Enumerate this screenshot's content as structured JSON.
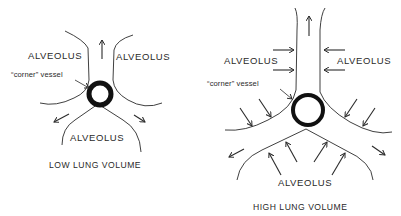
{
  "panels": [
    {
      "id": "low",
      "caption": "LOW LUNG VOLUME",
      "labels": {
        "top_left": "ALVEOLUS",
        "top_right": "ALVEOLUS",
        "bottom": "ALVEOLUS",
        "vessel": "“corner” vessel"
      }
    },
    {
      "id": "high",
      "caption": "HIGH LUNG VOLUME",
      "labels": {
        "top_left": "ALVEOLUS",
        "top_right": "ALVEOLUS",
        "bottom": "ALVEOLUS",
        "vessel": "“corner” vessel"
      }
    }
  ],
  "colors": {
    "ink": "#2a2a2a",
    "background": "#ffffff"
  }
}
